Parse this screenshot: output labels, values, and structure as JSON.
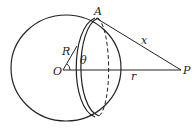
{
  "diagram": {
    "labels": {
      "A": "A",
      "x": "x",
      "R": "R",
      "theta": "θ",
      "O": "O",
      "r": "r",
      "P": "P"
    },
    "colors": {
      "stroke": "#222222",
      "background": "#ffffff"
    }
  }
}
